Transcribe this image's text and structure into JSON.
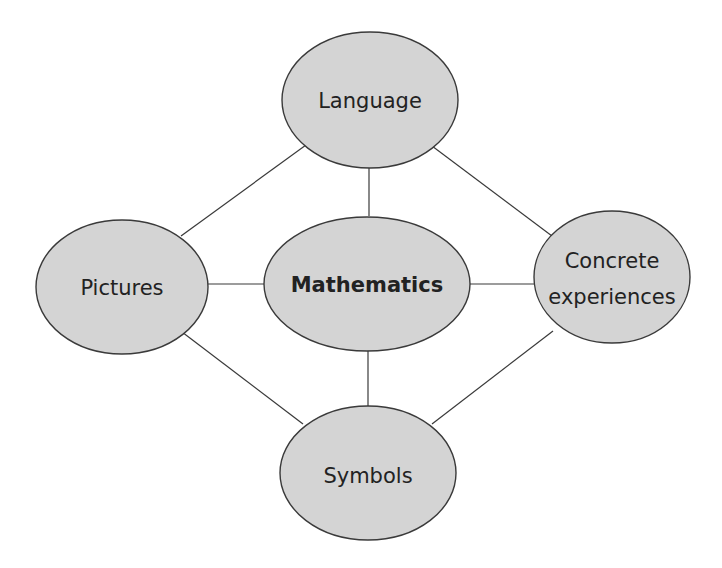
{
  "diagram": {
    "type": "concept-map",
    "center": {
      "id": "mathematics",
      "label": "Mathematics",
      "bold": true
    },
    "nodes": [
      {
        "id": "language",
        "label": "Language"
      },
      {
        "id": "pictures",
        "label": "Pictures"
      },
      {
        "id": "mathematics",
        "label": "Mathematics"
      },
      {
        "id": "concrete",
        "label_line1": "Concrete",
        "label_line2": "experiences"
      },
      {
        "id": "symbols",
        "label": "Symbols"
      }
    ],
    "edges": [
      [
        "language",
        "mathematics"
      ],
      [
        "language",
        "pictures"
      ],
      [
        "language",
        "concrete"
      ],
      [
        "pictures",
        "mathematics"
      ],
      [
        "mathematics",
        "concrete"
      ],
      [
        "mathematics",
        "symbols"
      ],
      [
        "pictures",
        "symbols"
      ],
      [
        "concrete",
        "symbols"
      ]
    ],
    "colors": {
      "node_fill": "#d4d4d4",
      "stroke": "#3a3a3a",
      "text": "#222222"
    }
  }
}
